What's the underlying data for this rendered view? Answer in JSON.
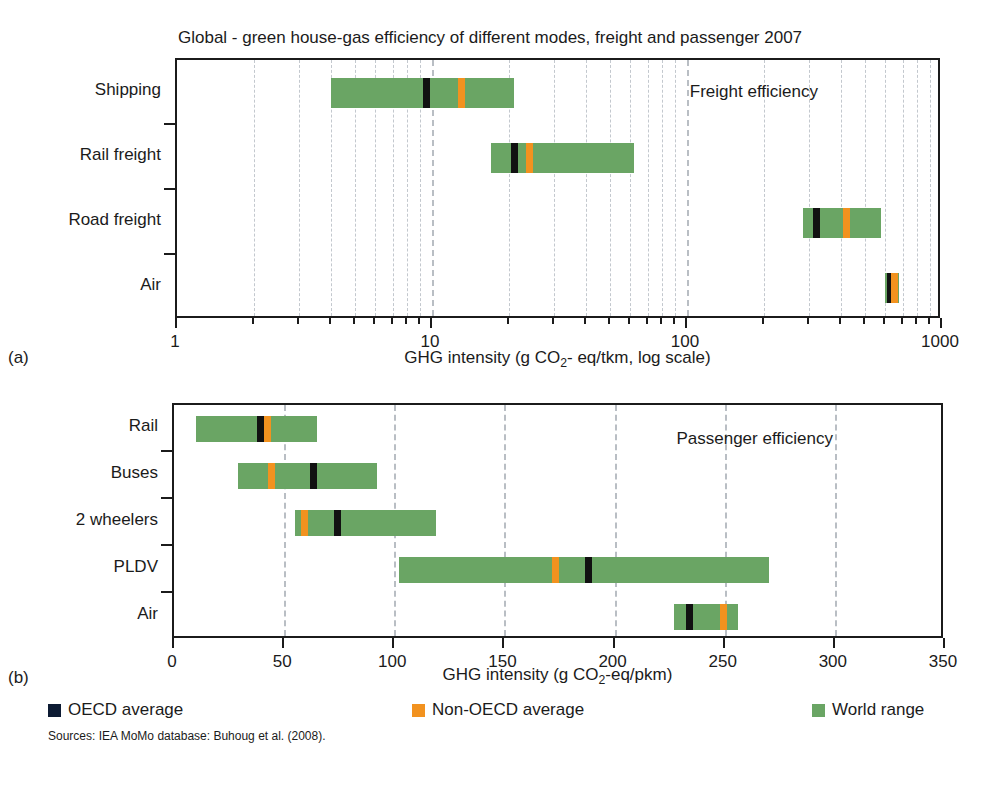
{
  "figure": {
    "title": "Global - green house-gas efficiency of different modes, freight and passenger 2007",
    "subfig_a": "(a)",
    "subfig_b": "(b)",
    "source": "Sources: IEA MoMo database: Buhoug et al. (2008)."
  },
  "legend": {
    "items": [
      {
        "label": "OECD average",
        "color": "#0d1b33"
      },
      {
        "label": "Non-OECD average",
        "color": "#f2921f"
      },
      {
        "label": "World range",
        "color": "#6aa564"
      }
    ]
  },
  "colors": {
    "range": "#6aa564",
    "oecd": "#111111",
    "non_oecd": "#f2921f",
    "grid": "#b9bec4",
    "axis": "#1b1b1b"
  },
  "chart_data": [
    {
      "id": "freight",
      "type": "bar",
      "orientation": "horizontal",
      "title": "Global - green house-gas efficiency of different modes, freight and passenger 2007",
      "annotation": "Freight efficiency",
      "xlabel": "GHG intensity (g CO2- eq/tkm, log scale)",
      "xlabel_parts": {
        "pre": "GHG intensity (g CO",
        "sub": "2",
        "post": "- eq/tkm, log scale)"
      },
      "ylabel": "",
      "scale": "log",
      "xlim": [
        1,
        1000
      ],
      "xticks": [
        1,
        10,
        100,
        1000
      ],
      "xticklabels": [
        "1",
        "10",
        "100",
        "1000"
      ],
      "grid": true,
      "categories": [
        "Shipping",
        "Rail freight",
        "Road freight",
        "Air"
      ],
      "ranges": [
        {
          "category": "Shipping",
          "low": 4,
          "high": 21,
          "oecd": 9.5,
          "non_oecd": 13
        },
        {
          "category": "Rail freight",
          "low": 17,
          "high": 62,
          "oecd": 21,
          "non_oecd": 24
        },
        {
          "category": "Road freight",
          "low": 285,
          "high": 575,
          "oecd": 320,
          "non_oecd": 420
        },
        {
          "category": "Air",
          "low": 600,
          "high": 680,
          "oecd": 625,
          "non_oecd": 650
        }
      ]
    },
    {
      "id": "passenger",
      "type": "bar",
      "orientation": "horizontal",
      "title": "",
      "annotation": "Passenger efficiency",
      "xlabel": "GHG intensity (g CO2-eq/pkm)",
      "xlabel_parts": {
        "pre": "GHG intensity (g CO",
        "sub": "2",
        "post": "-eq/pkm)"
      },
      "ylabel": "",
      "scale": "linear",
      "xlim": [
        0,
        350
      ],
      "xticks": [
        0,
        50,
        100,
        150,
        200,
        250,
        300,
        350
      ],
      "xticklabels": [
        "0",
        "50",
        "100",
        "150",
        "200",
        "250",
        "300",
        "350"
      ],
      "grid": true,
      "categories": [
        "Rail",
        "Buses",
        "2 wheelers",
        "PLDV",
        "Air"
      ],
      "ranges": [
        {
          "category": "Rail",
          "low": 10,
          "high": 65,
          "oecd": 39,
          "non_oecd": 42
        },
        {
          "category": "Buses",
          "low": 29,
          "high": 92,
          "oecd": 63,
          "non_oecd": 44
        },
        {
          "category": "2 wheelers",
          "low": 55,
          "high": 119,
          "oecd": 74,
          "non_oecd": 59
        },
        {
          "category": "PLDV",
          "low": 102,
          "high": 270,
          "oecd": 188,
          "non_oecd": 173
        },
        {
          "category": "Air",
          "low": 227,
          "high": 256,
          "oecd": 234,
          "non_oecd": 249
        }
      ]
    }
  ]
}
